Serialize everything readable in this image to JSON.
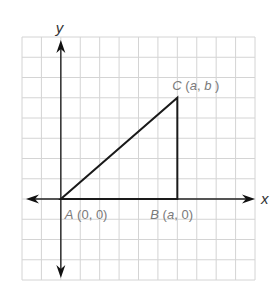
{
  "diagram": {
    "type": "coordinate-plane-triangle",
    "grid": {
      "columns": 12,
      "rows": 12,
      "left": 22,
      "top": 37,
      "right": 255,
      "bottom": 280,
      "line_color": "#d4d4d4"
    },
    "axes": {
      "x_label": "x",
      "y_label": "y",
      "origin_col": 2,
      "origin_row": 8,
      "color": "#222222"
    },
    "triangle": {
      "stroke": "#1a1a1a",
      "vertices": [
        {
          "name": "A",
          "coords": "(0, 0)",
          "col": 2,
          "row": 8
        },
        {
          "name": "B",
          "coords": "(a, 0)",
          "col": 8,
          "row": 8
        },
        {
          "name": "C",
          "coords": "(a, b)",
          "col": 8,
          "row": 3
        }
      ]
    },
    "labels": {
      "A": {
        "letter": "A",
        "rest": " (0, 0)"
      },
      "B": {
        "letter": "B",
        "rest_open": " (",
        "var": "a",
        "rest_close": ", 0)"
      },
      "C": {
        "letter": "C",
        "rest_open": " (",
        "var1": "a",
        "sep": ", ",
        "var2": "b",
        "rest_close": " )"
      }
    },
    "label_color": "#7a7a7a"
  }
}
